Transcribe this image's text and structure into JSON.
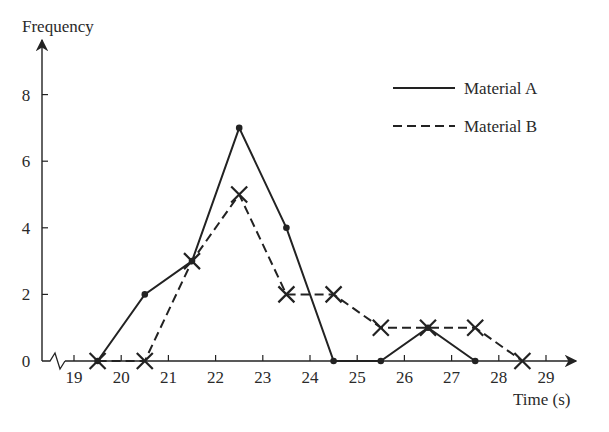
{
  "chart_data": {
    "type": "line",
    "title": "",
    "xlabel": "Time (s)",
    "ylabel": "Frequency",
    "x_ticks": [
      19,
      20,
      21,
      22,
      23,
      24,
      25,
      26,
      27,
      28,
      29
    ],
    "y_ticks": [
      0,
      2,
      4,
      6,
      8
    ],
    "xlim": [
      18.4,
      29.6
    ],
    "ylim": [
      0,
      9.6
    ],
    "axis_break": true,
    "grid": false,
    "legend_position": "upper right",
    "series": [
      {
        "name": "Material A",
        "style": "solid",
        "marker": "dot",
        "x": [
          19.5,
          20.5,
          21.5,
          22.5,
          23.5,
          24.5,
          25.5,
          26.5,
          27.5
        ],
        "values": [
          0,
          2,
          3,
          7,
          4,
          0,
          0,
          1,
          0
        ]
      },
      {
        "name": "Material B",
        "style": "dashed",
        "marker": "cross",
        "x": [
          19.5,
          20.5,
          21.5,
          22.5,
          23.5,
          24.5,
          25.5,
          26.5,
          27.5,
          28.5
        ],
        "values": [
          0,
          0,
          3,
          5,
          2,
          2,
          1,
          1,
          1,
          0
        ]
      }
    ]
  },
  "colors": {
    "ink": "#222222",
    "text": "#2a2a2a",
    "background": "#ffffff"
  }
}
